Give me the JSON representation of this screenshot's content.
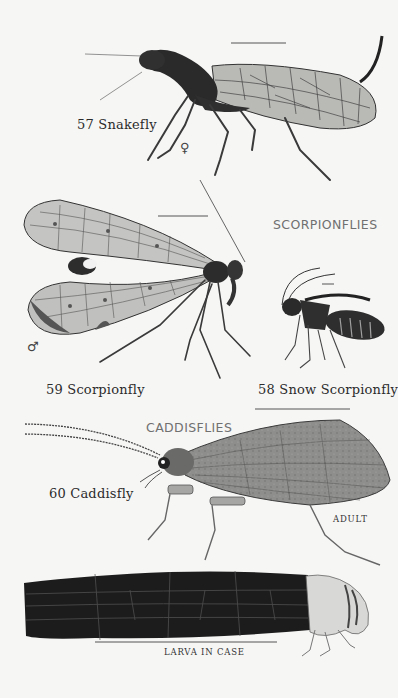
{
  "plate": {
    "background": "#f6f6f5",
    "sections": [
      {
        "heading": "SCORPIONFLIES"
      },
      {
        "heading": "CADDISFLIES"
      }
    ],
    "specimens": [
      {
        "number": "57",
        "name": "Snakefly",
        "label": "57 Snakefly",
        "sex_symbol": "♀"
      },
      {
        "number": "59",
        "name": "Scorpionfly",
        "label": "59 Scorpionfly",
        "sex_symbol": "♂"
      },
      {
        "number": "58",
        "name": "Snow Scorpionfly",
        "label": "58 Snow Scorpionfly"
      },
      {
        "number": "60",
        "name": "Caddisfly",
        "label": "60 Caddisfly",
        "stages": [
          "ADULT",
          "LARVA IN CASE"
        ]
      }
    ],
    "icons": [
      "female-symbol-icon",
      "male-symbol-icon",
      "scale-bar-icon"
    ]
  }
}
